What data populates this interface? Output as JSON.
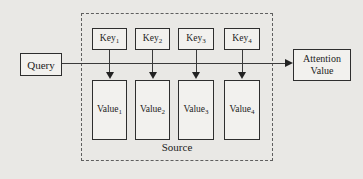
{
  "diagram": {
    "query": {
      "label": "Query"
    },
    "attention": {
      "line1": "Attention",
      "line2": "Value"
    },
    "source": {
      "label": "Source"
    },
    "keys": [
      {
        "base": "Key",
        "sub": "1"
      },
      {
        "base": "Key",
        "sub": "2"
      },
      {
        "base": "Key",
        "sub": "3"
      },
      {
        "base": "Key",
        "sub": "4"
      }
    ],
    "values": [
      {
        "base": "Value",
        "sub": "1"
      },
      {
        "base": "Value",
        "sub": "2"
      },
      {
        "base": "Value",
        "sub": "3"
      },
      {
        "base": "Value",
        "sub": "4"
      }
    ],
    "colors": {
      "background": "#e9e8e5",
      "box_fill": "#f2f1ee",
      "box_border": "#2e2e2e",
      "line": "#3a3a3a",
      "dashed_border": "#5f5f5f"
    }
  }
}
